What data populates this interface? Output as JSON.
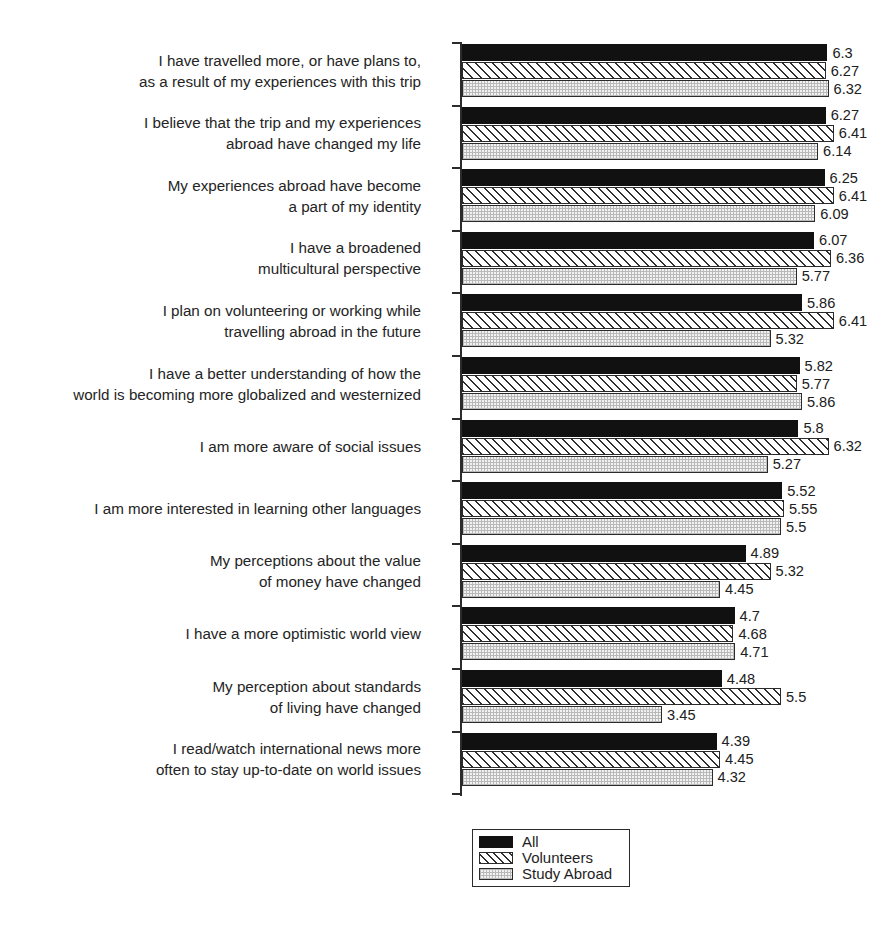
{
  "chart_data": {
    "type": "bar",
    "orientation": "horizontal",
    "title": "",
    "subtitle": "",
    "xlabel": "",
    "ylabel": "",
    "xlim": [
      0,
      7
    ],
    "grid": false,
    "legend_position": "bottom-center",
    "categories": [
      "I have travelled more, or have plans to,\nas a result of my experiences with this trip",
      "I believe that the trip and my experiences\nabroad have changed my life",
      "My experiences abroad have become\na part of my identity",
      "I have a broadened\nmulticultural perspective",
      "I plan on volunteering or working while\ntravelling abroad in the future",
      "I have a better understanding of how the\nworld is becoming more globalized and westernized",
      "I am more aware of social issues",
      "I am more interested in learning other languages",
      "My perceptions about the value\nof money have changed",
      "I have a more optimistic world view",
      "My perception about standards\nof living have changed",
      "I read/watch international news more\noften to stay up-to-date on world issues"
    ],
    "series": [
      {
        "name": "All",
        "key": "all",
        "pattern": "solid-black",
        "color": "#111111",
        "values": [
          6.3,
          6.27,
          6.25,
          6.07,
          5.86,
          5.82,
          5.8,
          5.52,
          4.89,
          4.7,
          4.48,
          4.39
        ],
        "labels": [
          "6.3",
          "6.27",
          "6.25",
          "6.07",
          "5.86",
          "5.82",
          "5.8",
          "5.52",
          "4.89",
          "4.7",
          "4.48",
          "4.39"
        ]
      },
      {
        "name": "Volunteers",
        "key": "volunteers",
        "pattern": "diagonal-hatch",
        "color": "#ffffff",
        "values": [
          6.27,
          6.41,
          6.41,
          6.36,
          6.41,
          5.77,
          6.32,
          5.55,
          5.32,
          4.68,
          5.5,
          4.45
        ],
        "labels": [
          "6.27",
          "6.41",
          "6.41",
          "6.36",
          "6.41",
          "5.77",
          "6.32",
          "5.55",
          "5.32",
          "4.68",
          "5.5",
          "4.45"
        ]
      },
      {
        "name": "Study Abroad",
        "key": "study_abroad",
        "pattern": "fine-dotted",
        "color": "#f2f2f2",
        "values": [
          6.32,
          6.14,
          6.09,
          5.77,
          5.32,
          5.86,
          5.27,
          5.5,
          4.45,
          4.71,
          3.45,
          4.32
        ],
        "labels": [
          "6.32",
          "6.14",
          "6.09",
          "5.77",
          "5.32",
          "5.86",
          "5.27",
          "5.5",
          "4.45",
          "4.71",
          "3.45",
          "4.32"
        ]
      }
    ]
  },
  "legend": {
    "items": [
      {
        "label": "All",
        "key": "all"
      },
      {
        "label": "Volunteers",
        "key": "volunteers"
      },
      {
        "label": "Study Abroad",
        "key": "study_abroad"
      }
    ]
  }
}
